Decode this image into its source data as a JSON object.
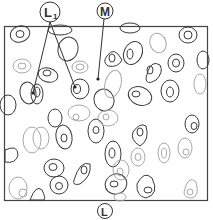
{
  "labels": {
    "l1": "L",
    "l1_sub": "1",
    "m": "M",
    "l": "L"
  },
  "colors": {
    "dark": "#3a3a3a",
    "light": "#a8a8a8",
    "frame": "#444444"
  }
}
